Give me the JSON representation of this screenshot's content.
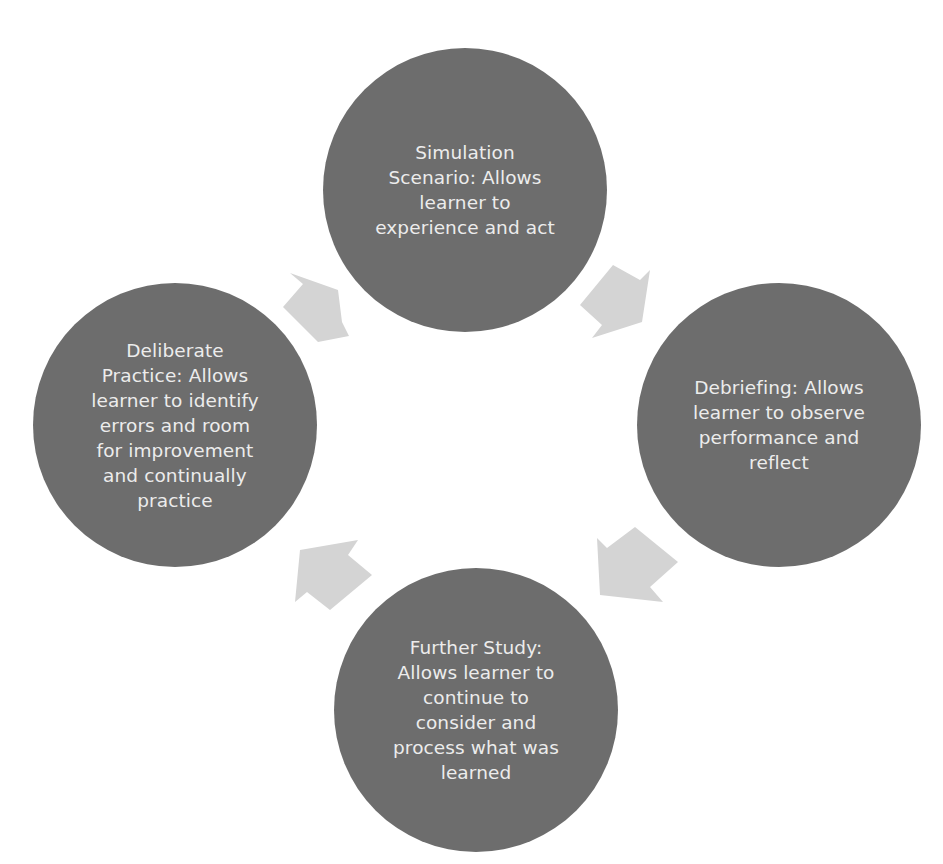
{
  "diagram": {
    "type": "cycle",
    "colors": {
      "node_fill": "#6d6d6d",
      "node_text": "#ececec",
      "arrow_fill": "#d4d4d4",
      "background": "#ffffff"
    },
    "nodes": [
      {
        "id": "simulation",
        "label": "Simulation\nScenario: Allows\nlearner to\nexperience and act"
      },
      {
        "id": "debriefing",
        "label": "Debriefing:  Allows\nlearner to observe\nperformance and\nreflect"
      },
      {
        "id": "further-study",
        "label": "Further Study:\nAllows learner to\ncontinue to\nconsider and\nprocess what was\nlearned"
      },
      {
        "id": "deliberate-practice",
        "label": "Deliberate\nPractice:  Allows\nlearner to identify\nerrors and room\nfor improvement\nand continually\npractice"
      }
    ],
    "edges": [
      {
        "from": "simulation",
        "to": "debriefing"
      },
      {
        "from": "debriefing",
        "to": "further-study"
      },
      {
        "from": "further-study",
        "to": "deliberate-practice"
      },
      {
        "from": "deliberate-practice",
        "to": "simulation"
      }
    ]
  }
}
